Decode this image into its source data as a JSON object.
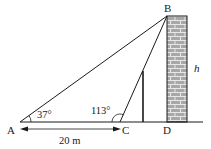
{
  "labels": {
    "A": "A",
    "B": "B",
    "C": "C",
    "D": "D",
    "h": "h",
    "angle_A": "37°",
    "angle_C": "113°",
    "distance_AC": "20 m"
  },
  "colors": {
    "line": "#1a1a1a",
    "brick_fill": "#a8a8a8",
    "mortar": "#e6e6e6"
  }
}
